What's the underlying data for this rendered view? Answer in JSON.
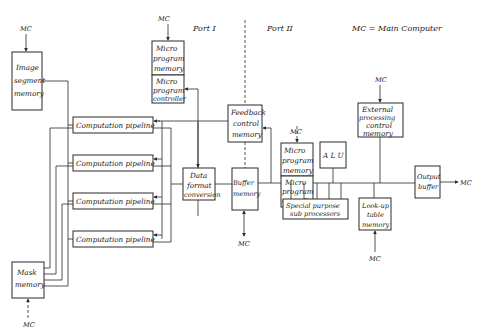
{
  "legend": {
    "text": "MC = Main Computer"
  },
  "ports": {
    "port1": "Port I",
    "port2": "Port II"
  },
  "mc_label": "MC",
  "blocks": {
    "image_segment_memory": [
      "Image",
      "segment",
      "memory"
    ],
    "micro_program_memory_left": [
      "Micro",
      "program",
      "memory"
    ],
    "micro_program_controller_left": [
      "Micro",
      "program",
      "controller"
    ],
    "feedback_control_memory": [
      "Feedback",
      "control",
      "memory"
    ],
    "micro_program_memory_right": [
      "Micro",
      "program",
      "memory"
    ],
    "micro_program_controller_right": [
      "Micro",
      "program",
      "controller"
    ],
    "alu": [
      "A L U"
    ],
    "external_processing_control_memory": [
      "External",
      "processing",
      "control",
      "memory"
    ],
    "computation_pipelines": [
      "Computation pipeline",
      "Computation pipeline",
      "Computation pipeline",
      "Computation pipeline"
    ],
    "data_format_conversion": [
      "Data",
      "format",
      "conversion"
    ],
    "buffer_memory": [
      "Buffer",
      "memory"
    ],
    "special_purpose_sub_processors": [
      "Special  purpose",
      "sub processors"
    ],
    "look_up_table_memory": [
      "Look-up",
      "table",
      "memory"
    ],
    "output_buffer": [
      "Output",
      "buffer"
    ],
    "mask_memory": [
      "Mask",
      "memory"
    ]
  }
}
